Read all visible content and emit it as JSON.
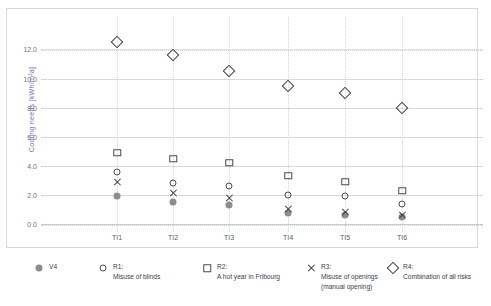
{
  "chart_data": {
    "type": "scatter",
    "title": "",
    "xlabel": "",
    "ylabel": "Cooling needs [kWh/m²a]",
    "categories": [
      "TI1",
      "TI2",
      "TI3",
      "TI4",
      "TI5",
      "TI6"
    ],
    "ylim": [
      0.0,
      13.2
    ],
    "yticks": [
      0.0,
      2.0,
      4.0,
      6.0,
      8.0,
      10.0,
      12.0
    ],
    "ytick_labels": [
      "0.0",
      "2.0",
      "4.0",
      "6.0",
      "8.0",
      "10.0",
      "12.0"
    ],
    "grid": "horizontal and vertical dotted gridlines",
    "legend_position": "below plot",
    "series": [
      {
        "name": "V4",
        "label": "V4",
        "sublabel": "",
        "marker": "filled-circle",
        "color": "#8d8d8d",
        "values": [
          1.9,
          1.5,
          1.3,
          0.75,
          0.6,
          0.45
        ]
      },
      {
        "name": "R1",
        "label": "R1:",
        "sublabel": "Misuse of blinds",
        "marker": "open-circle",
        "color": "#4a4a4a",
        "values": [
          3.6,
          2.8,
          2.6,
          2.0,
          1.9,
          1.35
        ]
      },
      {
        "name": "R2",
        "label": "R2:",
        "sublabel": "A hot year in Fribourg",
        "marker": "open-square",
        "color": "#4a4a4a",
        "values": [
          4.9,
          4.5,
          4.2,
          3.3,
          2.9,
          2.3
        ]
      },
      {
        "name": "R3",
        "label": "R3:",
        "sublabel": "Misuse of openings",
        "sublabel2": "(manual opening)",
        "marker": "cross",
        "color": "#3d3d3d",
        "values": [
          2.9,
          2.1,
          1.8,
          1.0,
          0.85,
          0.6
        ]
      },
      {
        "name": "R4",
        "label": "R4:",
        "sublabel": "Combination of all risks",
        "marker": "open-diamond",
        "color": "#3d3d3d",
        "values": [
          12.5,
          11.6,
          10.5,
          9.5,
          9.0,
          8.0
        ]
      }
    ]
  },
  "axis": {
    "y_title": "Cooling needs [kWh/m²a]",
    "y_title_color": "#7b6fae"
  },
  "legend": [
    {
      "label": "V4",
      "sublabel": "",
      "sublabel2": "",
      "marker": "filled-circle"
    },
    {
      "label": "R1:",
      "sublabel": "Misuse of blinds",
      "sublabel2": "",
      "marker": "open-circle"
    },
    {
      "label": "R2:",
      "sublabel": "A hot year in Fribourg",
      "sublabel2": "",
      "marker": "open-square"
    },
    {
      "label": "R3:",
      "sublabel": "Misuse of openings",
      "sublabel2": "(manual opening)",
      "marker": "cross"
    },
    {
      "label": "R4:",
      "sublabel": "Combination of all risks",
      "sublabel2": "",
      "marker": "open-diamond"
    }
  ]
}
